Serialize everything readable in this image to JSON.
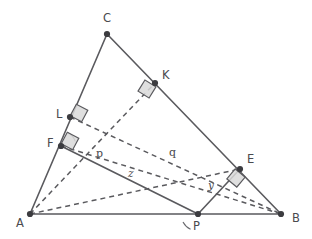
{
  "figure": {
    "canvas": {
      "width": 312,
      "height": 239,
      "background": "#ffffff"
    },
    "colors": {
      "stroke": "#5a5a5e",
      "vertex": "#3c3c40",
      "right_angle_fill": "#d9d9d9",
      "label": "#4a4a4e"
    }
  },
  "points": [
    {
      "id": "A",
      "label": "A",
      "x": 30,
      "y": 214,
      "label_x": 16,
      "label_y": 227
    },
    {
      "id": "B",
      "label": "B",
      "x": 281,
      "y": 214,
      "label_x": 292,
      "label_y": 222
    },
    {
      "id": "C",
      "label": "C",
      "x": 107,
      "y": 34,
      "label_x": 103,
      "label_y": 22
    },
    {
      "id": "P",
      "label": "P",
      "x": 198,
      "y": 214,
      "label_x": 193,
      "label_y": 230
    },
    {
      "id": "K",
      "label": "K",
      "x": 155,
      "y": 83,
      "label_x": 162,
      "label_y": 79
    },
    {
      "id": "L",
      "label": "L",
      "x": 70,
      "y": 117,
      "label_x": 56,
      "label_y": 118
    },
    {
      "id": "F",
      "label": "F",
      "x": 61,
      "y": 146,
      "label_x": 47,
      "label_y": 147
    },
    {
      "id": "E",
      "label": "E",
      "x": 240,
      "y": 169,
      "label_x": 247,
      "label_y": 163
    }
  ],
  "segments_solid": [
    {
      "id": "AB",
      "from": "A",
      "to": "B"
    },
    {
      "id": "AC",
      "from": "A",
      "to": "C"
    },
    {
      "id": "CB",
      "from": "C",
      "to": "B"
    },
    {
      "id": "FP",
      "from": "F",
      "to": "P"
    },
    {
      "id": "PE",
      "from": "P",
      "to": "E"
    }
  ],
  "segments_dashed": [
    {
      "id": "AK",
      "from": "A",
      "to": "K"
    },
    {
      "id": "LB",
      "from": "L",
      "to": "B"
    },
    {
      "id": "FB",
      "from": "F",
      "to": "B"
    },
    {
      "id": "AE",
      "from": "A",
      "to": "E"
    }
  ],
  "right_angles": [
    {
      "id": "right-angle-at-K",
      "x": 147,
      "y": 89,
      "size": 13,
      "rotation": 32
    },
    {
      "id": "right-angle-at-L",
      "x": 79,
      "y": 113,
      "size": 13,
      "rotation": 28
    },
    {
      "id": "right-angle-at-F",
      "x": 70,
      "y": 141,
      "size": 13,
      "rotation": 28
    },
    {
      "id": "right-angle-at-E",
      "x": 236,
      "y": 178,
      "size": 13,
      "rotation": 40
    }
  ],
  "length_labels": [
    {
      "id": "p",
      "text": "p",
      "x": 96,
      "y": 157,
      "style": "upright"
    },
    {
      "id": "q",
      "text": "q",
      "x": 169,
      "y": 156,
      "style": "upright"
    },
    {
      "id": "z",
      "text": "z",
      "x": 128,
      "y": 177,
      "style": "italic"
    },
    {
      "id": "y",
      "text": "y",
      "x": 208,
      "y": 189,
      "style": "italic"
    }
  ],
  "angle_arcs": [
    {
      "id": "angle-arc-at-F",
      "cx": 61,
      "cy": 146,
      "r": 15,
      "a_start": 18,
      "a_end": 62
    },
    {
      "id": "angle-arc-at-P",
      "cx": 198,
      "cy": 214,
      "r": 17,
      "a_start": 208,
      "a_end": 244
    }
  ]
}
